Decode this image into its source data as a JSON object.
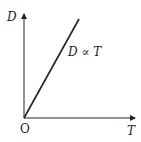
{
  "diagram": {
    "type": "proportionality-graph",
    "y_axis_label": "D",
    "x_axis_label": "T",
    "origin_label": "O",
    "line_label": "D ∝ T",
    "colors": {
      "line": "#222222",
      "axes": "#222222",
      "background": "#ffffff"
    }
  }
}
